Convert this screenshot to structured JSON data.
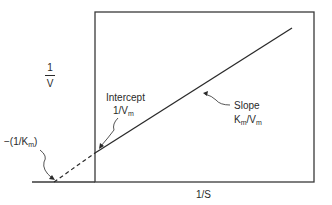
{
  "diagram": {
    "y_axis": {
      "numerator": "1",
      "denominator": "V"
    },
    "x_axis": {
      "label": "1/S"
    },
    "intercept": {
      "title": "Intercept",
      "value_main": "1/V",
      "value_sub": "m"
    },
    "slope": {
      "title": "Slope",
      "k": "K",
      "k_sub": "m",
      "slash": "/V",
      "v_sub": "m"
    },
    "x_intercept": {
      "prefix": "−(1/K",
      "sub": "m",
      "suffix": ")"
    },
    "colors": {
      "line": "#2a2a2a",
      "background": "#ffffff"
    }
  }
}
